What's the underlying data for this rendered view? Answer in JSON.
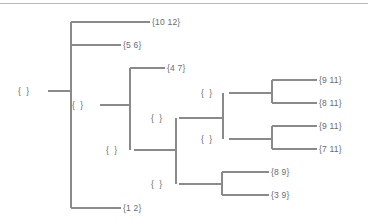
{
  "diagram": {
    "type": "hierarchical-set-partition-tree",
    "orientation": "left-to-right",
    "line_color": "#8a8a8a",
    "text_color": "#6b6b6b",
    "background_color": "#ffffff",
    "top_rule_color": "#b9b9b9",
    "root": {
      "id": "root",
      "label": "{  }",
      "x": 30,
      "y": 91
    },
    "internal_nodes": [
      {
        "id": "node-a",
        "label": "{  }",
        "x": 84,
        "y": 105
      },
      {
        "id": "node-b",
        "label": "{  }",
        "x": 118,
        "y": 150
      },
      {
        "id": "node-c",
        "label": "{  }",
        "x": 163,
        "y": 118
      },
      {
        "id": "node-d",
        "label": "{  }",
        "x": 213,
        "y": 93
      },
      {
        "id": "node-e",
        "label": "{  }",
        "x": 213,
        "y": 139
      },
      {
        "id": "node-f",
        "label": "{  }",
        "x": 163,
        "y": 184
      }
    ],
    "leaves": [
      {
        "id": "leaf-10-12",
        "label": "{10 12}",
        "x": 153,
        "y": 22
      },
      {
        "id": "leaf-5-6",
        "label": "{5 6}",
        "x": 124,
        "y": 45
      },
      {
        "id": "leaf-4-7",
        "label": "{4 7}",
        "x": 168,
        "y": 68
      },
      {
        "id": "leaf-9-11a",
        "label": "{9 11}",
        "x": 320,
        "y": 80
      },
      {
        "id": "leaf-8-11",
        "label": "{8 11}",
        "x": 320,
        "y": 103
      },
      {
        "id": "leaf-9-11b",
        "label": "{9 11}",
        "x": 320,
        "y": 126
      },
      {
        "id": "leaf-7-11",
        "label": "{7 11}",
        "x": 320,
        "y": 149
      },
      {
        "id": "leaf-8-9",
        "label": "{8 9}",
        "x": 272,
        "y": 172
      },
      {
        "id": "leaf-3-9",
        "label": "{3 9}",
        "x": 272,
        "y": 195
      },
      {
        "id": "leaf-1-2",
        "label": "{1 2}",
        "x": 124,
        "y": 208
      }
    ],
    "edges": [
      {
        "from": "root",
        "to": "spine-main",
        "kind": "horizontal",
        "x1": 48,
        "x2": 71,
        "y": 91
      },
      {
        "from": "spine-main",
        "kind": "vertical",
        "x": 71,
        "y1": 22,
        "y2": 208
      },
      {
        "from": "spine-main",
        "to": "leaf-10-12",
        "kind": "horizontal",
        "x1": 71,
        "x2": 150,
        "y": 22
      },
      {
        "from": "spine-main",
        "to": "leaf-5-6",
        "kind": "horizontal",
        "x1": 71,
        "x2": 121,
        "y": 45
      },
      {
        "from": "spine-main",
        "to": "leaf-1-2",
        "kind": "horizontal",
        "x1": 71,
        "x2": 121,
        "y": 208
      },
      {
        "from": "node-a",
        "to": "spine-a",
        "kind": "horizontal",
        "x1": 100,
        "x2": 130,
        "y": 105
      },
      {
        "from": "spine-a",
        "kind": "vertical",
        "x": 130,
        "y1": 68,
        "y2": 150
      },
      {
        "from": "spine-a",
        "to": "leaf-4-7",
        "kind": "horizontal",
        "x1": 130,
        "x2": 165,
        "y": 68
      },
      {
        "from": "node-b",
        "to": "spine-b",
        "kind": "horizontal",
        "x1": 134,
        "x2": 176,
        "y": 150
      },
      {
        "from": "spine-b",
        "kind": "vertical",
        "x": 176,
        "y1": 118,
        "y2": 184
      },
      {
        "from": "node-c",
        "to": "spine-c",
        "kind": "horizontal",
        "x1": 179,
        "x2": 223,
        "y": 118
      },
      {
        "from": "spine-c",
        "kind": "vertical",
        "x": 223,
        "y1": 93,
        "y2": 139
      },
      {
        "from": "node-d",
        "to": "spine-d",
        "kind": "horizontal",
        "x1": 229,
        "x2": 272,
        "y": 93
      },
      {
        "from": "spine-d",
        "kind": "vertical",
        "x": 272,
        "y1": 80,
        "y2": 103
      },
      {
        "from": "spine-d",
        "to": "leaf-9-11a",
        "kind": "horizontal",
        "x1": 272,
        "x2": 317,
        "y": 80
      },
      {
        "from": "spine-d",
        "to": "leaf-8-11",
        "kind": "horizontal",
        "x1": 272,
        "x2": 317,
        "y": 103
      },
      {
        "from": "node-e",
        "to": "spine-e",
        "kind": "horizontal",
        "x1": 229,
        "x2": 272,
        "y": 139
      },
      {
        "from": "spine-e",
        "kind": "vertical",
        "x": 272,
        "y1": 126,
        "y2": 149
      },
      {
        "from": "spine-e",
        "to": "leaf-9-11b",
        "kind": "horizontal",
        "x1": 272,
        "x2": 317,
        "y": 126
      },
      {
        "from": "spine-e",
        "to": "leaf-7-11",
        "kind": "horizontal",
        "x1": 272,
        "x2": 317,
        "y": 149
      },
      {
        "from": "node-f",
        "to": "spine-f",
        "kind": "horizontal",
        "x1": 179,
        "x2": 222,
        "y": 184
      },
      {
        "from": "spine-f",
        "kind": "vertical",
        "x": 222,
        "y1": 172,
        "y2": 195
      },
      {
        "from": "spine-f",
        "to": "leaf-8-9",
        "kind": "horizontal",
        "x1": 222,
        "x2": 269,
        "y": 172
      },
      {
        "from": "spine-f",
        "to": "leaf-3-9",
        "kind": "horizontal",
        "x1": 222,
        "x2": 269,
        "y": 195
      }
    ]
  }
}
